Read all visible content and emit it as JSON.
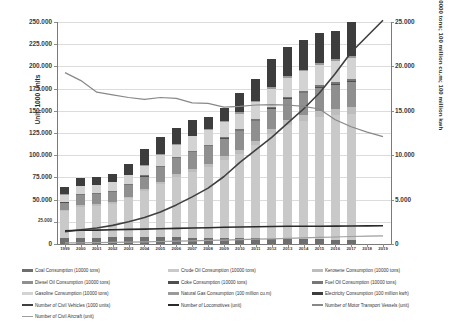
{
  "chart_data": {
    "type": "bar",
    "title": "",
    "xlabel": "",
    "ylabel": "Unit; 1000 Units",
    "ylabel_secondary": "10000 tons; 100 million cu.m; 100 million kwh",
    "grid": true,
    "legend_position": "bottom",
    "categories": [
      "1999",
      "2000",
      "2001",
      "2002",
      "2003",
      "2004",
      "2005",
      "2006",
      "2007",
      "2008",
      "2009",
      "2010",
      "2011",
      "2012",
      "2013",
      "2014",
      "2015",
      "2016",
      "2017",
      "2018",
      "2019"
    ],
    "ylim": [
      0,
      250000
    ],
    "yticks": [
      "0",
      "25.000",
      "50.000",
      "75.000",
      "100.000",
      "125.000",
      "150.000",
      "175.000",
      "200.000",
      "225.000",
      "250.000"
    ],
    "ylim_secondary": [
      0,
      25000
    ],
    "yticks_secondary": [
      "0",
      "5.000",
      "10.000",
      "15.000",
      "20.000",
      "25.000"
    ],
    "series": [
      {
        "name": "Coal Consumption (10000 tons)",
        "type": "bar",
        "color": "#6e6e6e",
        "values": [
          7000,
          7200,
          7300,
          7400,
          7500,
          7600,
          7700,
          7500,
          7300,
          7000,
          6800,
          6500,
          6300,
          6000,
          5800,
          5500,
          5200,
          5000,
          4800,
          0,
          0
        ]
      },
      {
        "name": "Crude Oil Consumption (10000 tons)",
        "type": "bar",
        "color": "#c9c9c9",
        "values": [
          30000,
          35000,
          36000,
          38000,
          44000,
          52000,
          60000,
          68000,
          74000,
          80000,
          88000,
          95000,
          105000,
          118000,
          128000,
          133000,
          138000,
          140000,
          142000,
          0,
          0
        ]
      },
      {
        "name": "Kerosene Consumption (10000 tons)",
        "type": "bar",
        "color": "#bdbdbd",
        "values": [
          1500,
          1600,
          1700,
          1800,
          2000,
          2300,
          2600,
          2900,
          3200,
          3500,
          3900,
          4300,
          4800,
          5300,
          5800,
          6300,
          6800,
          7200,
          7600,
          0,
          0
        ]
      },
      {
        "name": "Diesel Oil Consumption (10000 tons)",
        "type": "bar",
        "color": "#8f8f8f",
        "values": [
          8000,
          11000,
          11000,
          11500,
          12500,
          14000,
          16000,
          18000,
          19000,
          19500,
          20000,
          21000,
          22000,
          23000,
          24000,
          25000,
          26000,
          27000,
          28000,
          0,
          0
        ]
      },
      {
        "name": "Coke Consumption (10000 tons)",
        "type": "bar",
        "color": "#4f4f4f",
        "values": [
          400,
          420,
          430,
          440,
          460,
          480,
          500,
          520,
          540,
          560,
          580,
          600,
          620,
          640,
          660,
          680,
          700,
          720,
          740,
          0,
          0
        ]
      },
      {
        "name": "Fuel Oil Consumption (10000 tons)",
        "type": "bar",
        "color": "#777777",
        "values": [
          800,
          850,
          880,
          900,
          950,
          1000,
          1100,
          1200,
          1300,
          1400,
          1500,
          1600,
          1700,
          1800,
          1900,
          2000,
          2100,
          2200,
          2300,
          0,
          0
        ]
      },
      {
        "name": "Gasoline Consumption (10000 tons)",
        "type": "bar",
        "color": "#d3d3d3",
        "values": [
          8000,
          9000,
          9200,
          9500,
          10000,
          11000,
          12500,
          14000,
          16000,
          16500,
          17000,
          18000,
          19000,
          20000,
          21000,
          22000,
          23000,
          23500,
          24000,
          0,
          0
        ]
      },
      {
        "name": "Natural Gas Consumption (100 million cu.m)",
        "type": "bar",
        "color": "#9a9a9a",
        "values": [
          300,
          350,
          400,
          450,
          500,
          600,
          700,
          800,
          900,
          1000,
          1100,
          1200,
          1400,
          1600,
          1800,
          2000,
          2200,
          2400,
          2600,
          0,
          0
        ]
      },
      {
        "name": "Electricity Consumption (100 million kwh)",
        "type": "bar",
        "color": "#3d3d3d",
        "values": [
          8000,
          8600,
          9100,
          9000,
          12000,
          18000,
          19000,
          18000,
          18000,
          14000,
          14000,
          22000,
          25000,
          32000,
          33000,
          33000,
          34000,
          32000,
          38000,
          0,
          0
        ]
      },
      {
        "name": "Number of Civil Vehicles (1000 units)",
        "type": "line",
        "axis": "secondary",
        "color": "#404040",
        "width": 1.6,
        "values": [
          1400,
          1600,
          1800,
          2100,
          2500,
          3000,
          3600,
          4400,
          5300,
          6300,
          7600,
          9200,
          10600,
          12000,
          13600,
          15200,
          17000,
          19200,
          21600,
          23400,
          25200
        ]
      },
      {
        "name": "Number of Locomotives (unit)",
        "type": "line",
        "axis": "secondary",
        "color": "#2a2a2a",
        "width": 1.6,
        "values": [
          1500,
          1540,
          1570,
          1600,
          1640,
          1680,
          1720,
          1760,
          1800,
          1840,
          1880,
          1920,
          1950,
          1970,
          1990,
          2000,
          2010,
          2020,
          2030,
          2040,
          2050
        ]
      },
      {
        "name": "Number of Motor Transport Vessels (unit)",
        "type": "line",
        "axis": "secondary",
        "color": "#888888",
        "width": 1.2,
        "values": [
          19300,
          18400,
          17100,
          16800,
          16500,
          16300,
          16500,
          16400,
          15900,
          15850,
          15400,
          15500,
          15650,
          15700,
          15650,
          15500,
          15200,
          14000,
          13200,
          12600,
          12100
        ]
      },
      {
        "name": "Number of Civil Aircraft (unit)",
        "type": "line",
        "axis": "secondary",
        "color": "#9e9e9e",
        "width": 1.2,
        "values": [
          120,
          140,
          160,
          180,
          210,
          240,
          280,
          320,
          360,
          400,
          440,
          490,
          540,
          590,
          640,
          690,
          740,
          790,
          840,
          880,
          920
        ]
      }
    ]
  },
  "legend": {
    "items": [
      {
        "label": "Coal Consumption (10000 tons)",
        "color": "#6e6e6e",
        "kind": "bar",
        "col": 0,
        "row": 0
      },
      {
        "label": "Crude Oil Consumption (10000 tons)",
        "color": "#c9c9c9",
        "kind": "bar",
        "col": 1,
        "row": 0
      },
      {
        "label": "Kerosene Consumption (10000 tons)",
        "color": "#bdbdbd",
        "kind": "bar",
        "col": 2,
        "row": 0
      },
      {
        "label": "Diesel Oil Consumption (10000 tons)",
        "color": "#8f8f8f",
        "kind": "bar",
        "col": 0,
        "row": 1
      },
      {
        "label": "Coke Consumption (10000 tons)",
        "color": "#4f4f4f",
        "kind": "bar",
        "col": 1,
        "row": 1
      },
      {
        "label": "Fuel Oil Consumption (10000 tons)",
        "color": "#777777",
        "kind": "bar",
        "col": 2,
        "row": 1
      },
      {
        "label": "Gasoline Consumption (10000 tons)",
        "color": "#d3d3d3",
        "kind": "bar",
        "col": 0,
        "row": 2
      },
      {
        "label": "Natural Gas Consumption (100 million cu.m)",
        "color": "#9a9a9a",
        "kind": "bar",
        "col": 1,
        "row": 2
      },
      {
        "label": "Electricity Consumption (100 million kwh)",
        "color": "#3d3d3d",
        "kind": "bar",
        "col": 2,
        "row": 2
      },
      {
        "label": "Number of Civil Vehicles (1000 units)",
        "color": "#404040",
        "kind": "line-thick",
        "col": 0,
        "row": 3
      },
      {
        "label": "Number of Locomotives (unit)",
        "color": "#2a2a2a",
        "kind": "line-thick",
        "col": 1,
        "row": 3
      },
      {
        "label": "Number of Motor Transport Vessels (unit)",
        "color": "#888888",
        "kind": "line",
        "col": 2,
        "row": 3
      },
      {
        "label": "Number of Civil Aircraft (unit)",
        "color": "#9e9e9e",
        "kind": "line",
        "col": 0,
        "row": 4
      }
    ]
  }
}
